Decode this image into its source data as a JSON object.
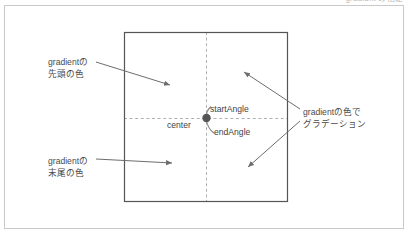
{
  "figure": {
    "top_caption": "gradient の指定",
    "canvas": {
      "frame_label": "diagram-frame",
      "border_color": "#c9c9c9",
      "background": "#ffffff"
    },
    "shape": {
      "name": "gradient-rectangle",
      "stroke_color": "#555555",
      "x": 124,
      "y": 32,
      "width": 163,
      "height": 169
    },
    "guides": {
      "dash_color": "#b0b0b0",
      "horizontal_y": 118,
      "vertical_x": 206
    },
    "center_point": {
      "label": "center",
      "x": 206,
      "y": 118,
      "color": "#555555"
    },
    "arcs": {
      "start_angle_label": "startAngle",
      "end_angle_label": "endAngle",
      "color": "#8a8a8a"
    },
    "annotations": [
      {
        "name": "gradient-head-color",
        "line1": "gradientの",
        "line2": "先頭の色",
        "arrow_color": "#6d6d6d"
      },
      {
        "name": "gradient-tail-color",
        "line1": "gradientの",
        "line2": "末尾の色",
        "arrow_color": "#6d6d6d"
      },
      {
        "name": "gradient-fill-description",
        "line1": "gradientの色で",
        "line2": "グラデーション",
        "arrow_color": "#6d6d6d"
      }
    ]
  }
}
